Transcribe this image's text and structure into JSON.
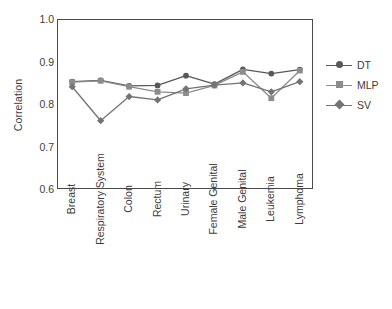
{
  "chart_data": {
    "type": "line",
    "title": "",
    "xlabel": "",
    "ylabel": "Correlation",
    "ylim": [
      0.6,
      1.0
    ],
    "yticks": [
      1.0,
      0.9,
      0.8,
      0.7,
      0.6
    ],
    "ytick_labels": [
      "1.0",
      "0.9",
      "0.8",
      "0.7",
      "0.6"
    ],
    "grid": false,
    "legend_position": "right",
    "categories": [
      "Breast",
      "Respiratory System",
      "Colon",
      "Rectum",
      "Urinary",
      "Female Genital",
      "Male Genital",
      "Leukemia",
      "Lymphoma"
    ],
    "series": [
      {
        "name": "DT",
        "color": "#595959",
        "marker": "circle",
        "values": [
          0.855,
          0.858,
          0.845,
          0.846,
          0.869,
          0.849,
          0.884,
          0.874,
          0.883
        ]
      },
      {
        "name": "MLP",
        "color": "#8c8c8c",
        "marker": "square",
        "values": [
          0.854,
          0.857,
          0.843,
          0.831,
          0.828,
          0.846,
          0.878,
          0.816,
          0.881
        ]
      },
      {
        "name": "SV",
        "color": "#737373",
        "marker": "diamond",
        "values": [
          0.843,
          0.763,
          0.82,
          0.812,
          0.838,
          0.847,
          0.852,
          0.831,
          0.855
        ]
      }
    ]
  },
  "legend": {
    "entries": [
      {
        "label": "DT"
      },
      {
        "label": "MLP"
      },
      {
        "label": "SV"
      }
    ]
  }
}
